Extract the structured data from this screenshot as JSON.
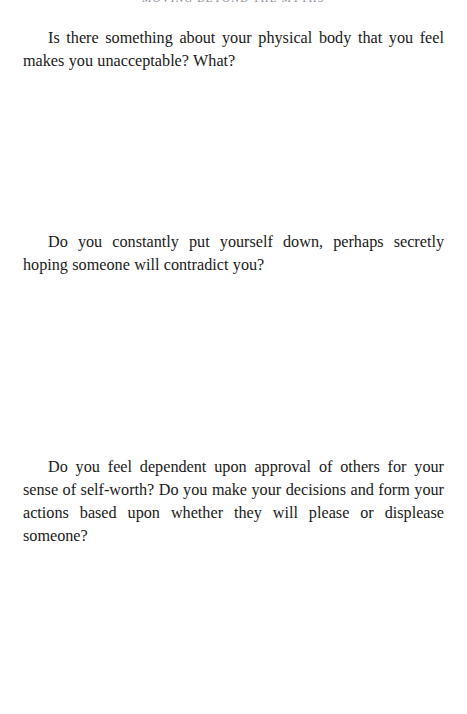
{
  "page": {
    "running_head": "MOVING BEYOND THE MYTHS",
    "background_color": "#ffffff",
    "text_color": "#1a1a1a",
    "running_head_color": "#8d8d96"
  },
  "content": {
    "paragraphs": [
      {
        "id": "question-physical-body",
        "text": "Is there something about your physical body that you feel makes you unacceptable? What?"
      },
      {
        "id": "question-put-yourself-down",
        "text": "Do you constantly put yourself down, perhaps secretly hoping someone will contradict you?"
      },
      {
        "id": "question-dependent-on-approval",
        "text": "Do you feel dependent upon approval of others for your sense of self-worth? Do you make your decisions and form your actions based upon whether they will please or displease someone?"
      }
    ]
  }
}
